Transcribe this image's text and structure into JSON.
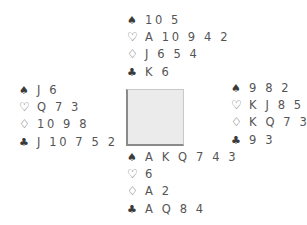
{
  "deal": {
    "north": {
      "spades": "10 5",
      "hearts": "A 10 9 4 2",
      "diamonds": "J 6 5 4",
      "clubs": "K 6"
    },
    "west": {
      "spades": "J 6",
      "hearts": "Q 7 3",
      "diamonds": "10 9 8",
      "clubs": "J 10 7 5 2"
    },
    "east": {
      "spades": "9 8 2",
      "hearts": "K J 8 5",
      "diamonds": "K Q 7 3",
      "clubs": "9 3"
    },
    "south": {
      "spades": "A K Q 7 4 3",
      "hearts": "6",
      "diamonds": "A 2",
      "clubs": "A Q 8 4"
    }
  },
  "suits": {
    "spades": "♠",
    "hearts": "♡",
    "diamonds": "♢",
    "clubs": "♣"
  },
  "colors": {
    "text": "#555555",
    "table_fill": "#ebebeb",
    "table_border": "#8a8a8a"
  }
}
